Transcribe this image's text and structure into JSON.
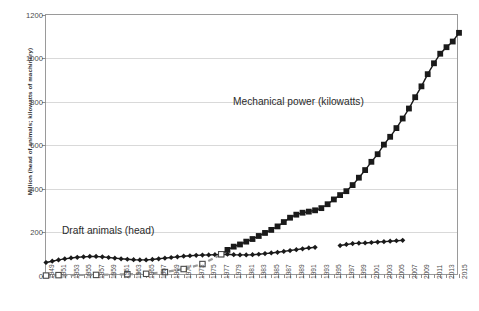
{
  "chart_data": {
    "type": "line",
    "title": "",
    "xlabel": "",
    "ylabel": "Million (head of animals; kilowatts of machinery)",
    "ylim": [
      0,
      1200
    ],
    "yticks": [
      0,
      200,
      400,
      600,
      800,
      1000,
      1200
    ],
    "xlim": [
      1949,
      2015
    ],
    "grid": true,
    "legend_position": "none",
    "xtick_labels": [
      "1949",
      "1951",
      "1953",
      "1955",
      "1957",
      "1959",
      "1961",
      "1963",
      "1965",
      "1967",
      "1969",
      "1971",
      "1973",
      "1975",
      "1977",
      "1979",
      "1981",
      "1983",
      "1985",
      "1987",
      "1989",
      "1991",
      "1993",
      "1995",
      "1997",
      "1999",
      "2001",
      "2003",
      "2005",
      "2007",
      "2009",
      "2011",
      "2013",
      "2015"
    ],
    "annotations": [
      {
        "id": "mech",
        "text": "Mechanical power (kilowatts)"
      },
      {
        "id": "draft",
        "text": "Draft animals (head)"
      }
    ],
    "series": [
      {
        "name": "Draft animals (head)",
        "marker": "diamond",
        "color": "#1a1a1a",
        "style": "solid",
        "points": [
          [
            1949,
            62
          ],
          [
            1950,
            68
          ],
          [
            1951,
            74
          ],
          [
            1952,
            79
          ],
          [
            1953,
            83
          ],
          [
            1954,
            86
          ],
          [
            1955,
            88
          ],
          [
            1956,
            90
          ],
          [
            1957,
            90
          ],
          [
            1958,
            88
          ],
          [
            1959,
            85
          ],
          [
            1960,
            82
          ],
          [
            1961,
            79
          ],
          [
            1962,
            77
          ],
          [
            1963,
            75
          ],
          [
            1964,
            74
          ],
          [
            1965,
            74
          ],
          [
            1966,
            76
          ],
          [
            1967,
            79
          ],
          [
            1968,
            82
          ],
          [
            1969,
            85
          ],
          [
            1970,
            88
          ],
          [
            1971,
            91
          ],
          [
            1972,
            93
          ],
          [
            1973,
            95
          ],
          [
            1974,
            96
          ],
          [
            1975,
            97
          ],
          [
            1976,
            98
          ],
          [
            1977,
            99
          ],
          [
            1978,
            100
          ],
          [
            1979,
            98
          ],
          [
            1980,
            97
          ],
          [
            1981,
            97
          ],
          [
            1982,
            98
          ],
          [
            1983,
            100
          ],
          [
            1984,
            103
          ],
          [
            1985,
            106
          ],
          [
            1986,
            109
          ],
          [
            1987,
            113
          ],
          [
            1988,
            117
          ],
          [
            1989,
            121
          ],
          [
            1990,
            125
          ],
          [
            1991,
            129
          ],
          [
            1992,
            132
          ]
        ]
      },
      {
        "name": "Draft animals (head) segment 2",
        "marker": "diamond",
        "color": "#1a1a1a",
        "style": "solid",
        "points": [
          [
            1996,
            140
          ],
          [
            1997,
            145
          ],
          [
            1998,
            149
          ],
          [
            1999,
            151
          ],
          [
            2000,
            152
          ],
          [
            2001,
            154
          ],
          [
            2002,
            156
          ],
          [
            2003,
            158
          ],
          [
            2004,
            160
          ],
          [
            2005,
            162
          ],
          [
            2006,
            164
          ]
        ]
      },
      {
        "name": "Mechanical power (kilowatts)",
        "marker": "square",
        "color": "#1a1a1a",
        "style": "solid",
        "points": [
          [
            1977,
            100
          ],
          [
            1978,
            120
          ],
          [
            1979,
            135
          ],
          [
            1980,
            145
          ],
          [
            1981,
            158
          ],
          [
            1982,
            170
          ],
          [
            1983,
            184
          ],
          [
            1984,
            198
          ],
          [
            1985,
            212
          ],
          [
            1986,
            228
          ],
          [
            1987,
            248
          ],
          [
            1988,
            268
          ],
          [
            1989,
            282
          ],
          [
            1990,
            291
          ],
          [
            1991,
            296
          ],
          [
            1992,
            302
          ],
          [
            1993,
            312
          ],
          [
            1994,
            330
          ],
          [
            1995,
            352
          ],
          [
            1996,
            372
          ],
          [
            1997,
            390
          ],
          [
            1998,
            418
          ],
          [
            1999,
            452
          ],
          [
            2000,
            487
          ],
          [
            2001,
            525
          ],
          [
            2002,
            560
          ],
          [
            2003,
            604
          ],
          [
            2004,
            640
          ],
          [
            2005,
            680
          ],
          [
            2006,
            724
          ],
          [
            2007,
            770
          ],
          [
            2008,
            822
          ],
          [
            2009,
            872
          ],
          [
            2010,
            928
          ],
          [
            2011,
            978
          ],
          [
            2012,
            1022
          ],
          [
            2013,
            1052
          ],
          [
            2014,
            1078
          ],
          [
            2015,
            1118
          ]
        ]
      },
      {
        "name": "Mechanical power (early, interpolated)",
        "marker": "square-open",
        "color": "#9a9a9a",
        "style": "dashed",
        "points": [
          [
            1949,
            2
          ],
          [
            1951,
            4
          ],
          [
            1957,
            5
          ],
          [
            1962,
            8
          ],
          [
            1965,
            10
          ],
          [
            1968,
            18
          ],
          [
            1971,
            32
          ],
          [
            1974,
            55
          ],
          [
            1977,
            100
          ]
        ]
      }
    ]
  }
}
